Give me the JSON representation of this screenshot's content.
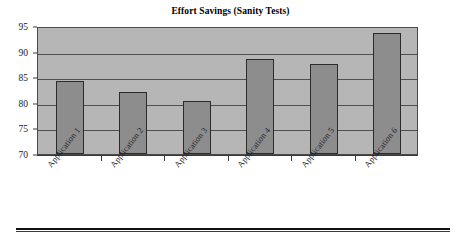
{
  "chart_data": {
    "type": "bar",
    "title": "Effort Savings (Sanity Tests)",
    "xlabel": "",
    "ylabel": "",
    "categories": [
      "Application 1",
      "Application 2",
      "Application 3",
      "Application 4",
      "Application 5",
      "Application 6"
    ],
    "values": [
      84.2,
      82.2,
      80.4,
      88.5,
      87.6,
      93.7
    ],
    "ylim": [
      70,
      95
    ],
    "yticks": [
      70,
      75,
      80,
      85,
      90,
      95
    ],
    "ytick_labels": [
      "70",
      "75",
      "80",
      "85",
      "90",
      "95"
    ],
    "grid": true,
    "grid_axis": "y",
    "legend": "none",
    "plot_background": "#b6b6b6",
    "bar_fill": "#8d8d8d",
    "bar_edge": "#2b2b2b",
    "page_background": "#ffffff"
  }
}
